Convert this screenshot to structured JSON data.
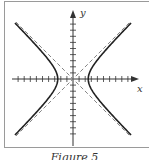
{
  "figure": {
    "caption": "Figure 5",
    "x_axis_label": "x",
    "y_axis_label": "y",
    "curve_color": "#222222",
    "asymptote_color": "#666666",
    "axis_color": "#333333"
  },
  "diagram": {
    "type": "hyperbola",
    "equation": "x^2 - y^2 = a^2",
    "vertex_units": 2.5,
    "asymptotes": [
      "y = x",
      "y = -x"
    ],
    "tick_count_each_direction": 9,
    "grid": false
  }
}
